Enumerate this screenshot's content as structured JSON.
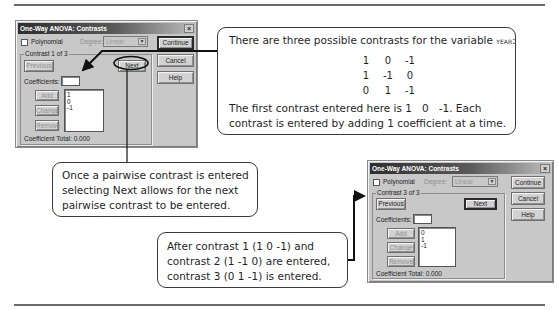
{
  "dialog_1": {
    "title": "One-Way ANOVA: Contrasts",
    "close_label": "×",
    "polynomial_label": "Polynomial",
    "polynomial_checked": false,
    "degree_label": "Degree:",
    "degree_value": "Linear",
    "group_label": "Contrast 1 of 3",
    "previous_label": "Previous",
    "next_label": "Next",
    "coefficients_label": "Coefficients:",
    "coefficients_value": "",
    "add_label": "Add",
    "change_label": "Change",
    "remove_label": "Remove",
    "coefficients_list": [
      "1",
      "0",
      "-1"
    ],
    "coefficient_total_label": "Coefficient Total:",
    "coefficient_total_value": "0.000",
    "continue_label": "Continue",
    "cancel_label": "Cancel",
    "help_label": "Help"
  },
  "dialog_2": {
    "title": "One-Way ANOVA: Contrasts",
    "close_label": "×",
    "polynomial_label": "Polynomial",
    "polynomial_checked": false,
    "degree_label": "Degree:",
    "degree_value": "Linear",
    "group_label": "Contrast 3 of 3",
    "previous_label": "Previous",
    "next_label": "Next",
    "coefficients_label": "Coefficients:",
    "coefficients_value": "",
    "add_label": "Add",
    "change_label": "Change",
    "remove_label": "Remove",
    "coefficients_list": [
      "0",
      "1",
      "-1"
    ],
    "coefficient_total_label": "Coefficient Total:",
    "coefficient_total_value": "0.000",
    "continue_label": "Continue",
    "cancel_label": "Cancel",
    "help_label": "Help"
  },
  "callouts": {
    "contrasts_intro": {
      "line1_prefix": "There are three possible contrasts for the variable ",
      "line1_variable": "year",
      "line1_suffix": ":",
      "matrix": [
        [
          "1",
          "0",
          "-1"
        ],
        [
          "1",
          "-1",
          "0"
        ],
        [
          "0",
          "1",
          "-1"
        ]
      ],
      "line_after_1": "The first contrast entered here is 1   0   -1. Each",
      "line_after_2": "contrast is entered by adding 1 coefficient at a time."
    },
    "next_explanation": {
      "lines": [
        "Once a pairwise contrast is entered",
        "selecting Next allows for the next",
        "pairwise contrast to be entered."
      ]
    },
    "contrast_3_explanation": {
      "lines": [
        "After contrast 1 (1 0 -1) and",
        "contrast 2 (1 -1 0) are entered,",
        "contrast 3 (0 1 -1) is entered."
      ]
    }
  }
}
